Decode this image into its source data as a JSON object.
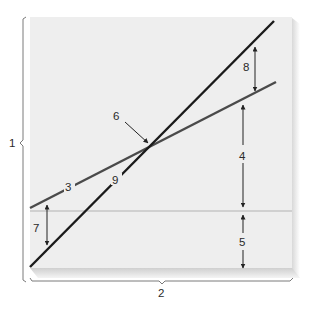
{
  "diagram": {
    "type": "line-intersection-chart",
    "colors": {
      "panel": "#eeeeee",
      "panel_shadow": "#cfcfcf",
      "steep_line": "#1a1a1a",
      "shallow_line": "#4a4a4a",
      "baseline": "#c4c4c4",
      "bracket": "#777777",
      "arrow": "#222222"
    },
    "labels": {
      "vertical_axis": "1",
      "horizontal_axis": "2",
      "shallow_line": "3",
      "upper_gap_right": "4",
      "lower_gap_right": "5",
      "intersection_point": "6",
      "gap_left": "7",
      "gap_top_right": "8",
      "steep_line": "9"
    },
    "lines": [
      {
        "id": "steep",
        "label": "9",
        "from": [
          30,
          267
        ],
        "to": [
          274,
          21
        ]
      },
      {
        "id": "shallow",
        "label": "3",
        "from": [
          30,
          208
        ],
        "to": [
          276,
          82
        ]
      },
      {
        "id": "horizontal",
        "from": [
          30,
          211
        ],
        "to": [
          293,
          211
        ]
      }
    ],
    "intersection": [
      151,
      146
    ]
  }
}
